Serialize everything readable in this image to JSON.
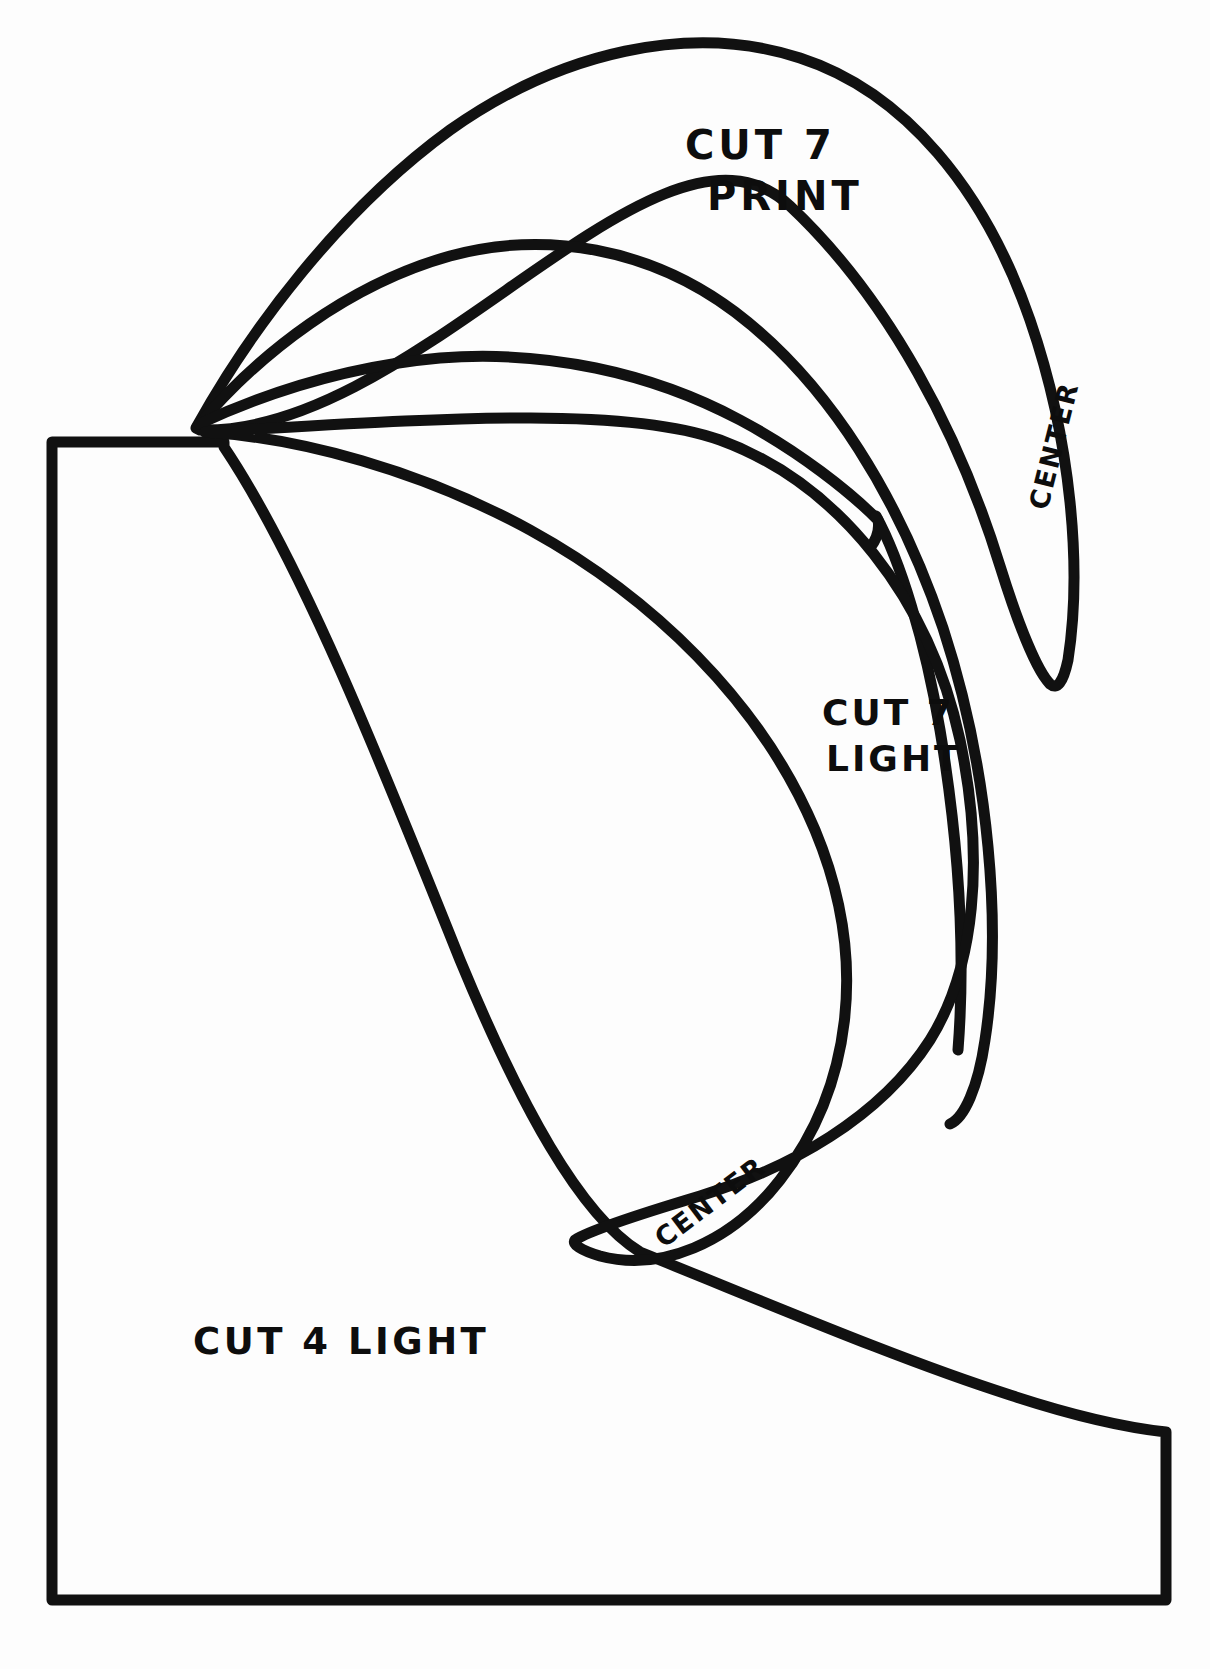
{
  "document": {
    "kind": "sewing-pattern-template",
    "background_color": "#fdfdfd",
    "ink_color": "#111111",
    "width": 1210,
    "height": 1669
  },
  "labels": {
    "cut7print": {
      "line1": "CUT 7",
      "line2": "PRINT"
    },
    "cut7light": {
      "line1": "CUT 7",
      "line2": "LIGHT"
    },
    "cut4light": {
      "text": "CUT 4 LIGHT"
    },
    "center_upper": {
      "text": "CENTER"
    },
    "center_lower": {
      "text": "CENTER"
    }
  },
  "shapes": {
    "base_block": {
      "name": "cut-4-light-block",
      "description": "large rounded-corner block with curved upper-right cutaway"
    },
    "petal_outer": {
      "name": "cut-7-print-petal",
      "description": "outermost crescent petal, tip at upper-left convergence point"
    },
    "petal_middle": {
      "name": "petal-middle",
      "description": "second crescent petal nested inside the outer petal"
    },
    "petal_inner": {
      "name": "petal-inner",
      "description": "third crescent petal nested inside the middle petal"
    },
    "petal_light": {
      "name": "cut-7-light-petal",
      "description": "large lower petal overlapping the base block"
    }
  }
}
